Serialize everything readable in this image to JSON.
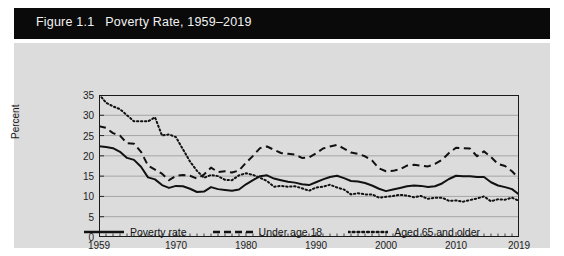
{
  "figure": {
    "title": "Figure 1.1   Poverty Rate, 1959–2019",
    "title_band_color": "#0a0a0a",
    "title_text_color": "#f2f2f2",
    "panel_color": "#dcdcdc"
  },
  "axes": {
    "ylabel": "Percent",
    "yticks": [
      "0",
      "5",
      "10",
      "15",
      "20",
      "25",
      "30",
      "35"
    ],
    "xticks": [
      "1959",
      "1970",
      "1980",
      "1990",
      "2000",
      "2010",
      "2019"
    ]
  },
  "legend": {
    "items": [
      {
        "label": "Poverty rate",
        "style": "solid",
        "color": "#111111"
      },
      {
        "label": "Under age 18",
        "style": "dashed",
        "color": "#111111"
      },
      {
        "label": "Aged 65 and older",
        "style": "dotted",
        "color": "#111111"
      }
    ]
  },
  "chart_data": {
    "type": "line",
    "title": "Figure 1.1   Poverty Rate, 1959–2019",
    "xlabel": "",
    "ylabel": "Percent",
    "xlim": [
      1959,
      2019
    ],
    "ylim": [
      0,
      35
    ],
    "ytick_step": 5,
    "grid": "horizontal",
    "legend_position": "bottom-center",
    "x": [
      1959,
      1960,
      1961,
      1962,
      1963,
      1964,
      1965,
      1966,
      1967,
      1968,
      1969,
      1970,
      1971,
      1972,
      1973,
      1974,
      1975,
      1976,
      1977,
      1978,
      1979,
      1980,
      1981,
      1982,
      1983,
      1984,
      1985,
      1986,
      1987,
      1988,
      1989,
      1990,
      1991,
      1992,
      1993,
      1994,
      1995,
      1996,
      1997,
      1998,
      1999,
      2000,
      2001,
      2002,
      2003,
      2004,
      2005,
      2006,
      2007,
      2008,
      2009,
      2010,
      2011,
      2012,
      2013,
      2014,
      2015,
      2016,
      2017,
      2018,
      2019
    ],
    "series": [
      {
        "name": "Poverty rate",
        "style": "solid",
        "values": [
          22.4,
          22.2,
          21.9,
          21.0,
          19.5,
          19.0,
          17.3,
          14.7,
          14.2,
          12.8,
          12.1,
          12.6,
          12.5,
          11.9,
          11.1,
          11.2,
          12.3,
          11.8,
          11.6,
          11.4,
          11.7,
          13.0,
          14.0,
          15.0,
          15.2,
          14.4,
          14.0,
          13.6,
          13.4,
          13.0,
          12.8,
          13.5,
          14.2,
          14.8,
          15.1,
          14.5,
          13.8,
          13.7,
          13.3,
          12.7,
          11.9,
          11.3,
          11.7,
          12.1,
          12.5,
          12.7,
          12.6,
          12.3,
          12.5,
          13.2,
          14.3,
          15.1,
          15.0,
          15.0,
          14.8,
          14.8,
          13.5,
          12.7,
          12.3,
          11.8,
          10.5
        ]
      },
      {
        "name": "Under age 18",
        "style": "dashed",
        "values": [
          27.3,
          26.9,
          25.6,
          25.0,
          23.1,
          23.0,
          21.0,
          17.6,
          16.6,
          15.6,
          14.0,
          15.1,
          15.3,
          15.1,
          14.4,
          15.4,
          17.1,
          16.0,
          16.2,
          15.9,
          16.4,
          18.3,
          20.0,
          21.9,
          22.3,
          21.5,
          20.7,
          20.5,
          20.3,
          19.5,
          19.6,
          20.6,
          21.8,
          22.3,
          22.7,
          21.8,
          20.8,
          20.5,
          19.9,
          18.9,
          16.9,
          16.2,
          16.3,
          16.7,
          17.6,
          17.8,
          17.6,
          17.4,
          18.0,
          19.0,
          20.7,
          22.0,
          21.9,
          21.8,
          19.9,
          21.1,
          19.7,
          18.0,
          17.5,
          16.2,
          14.4
        ]
      },
      {
        "name": "Aged 65 and older",
        "style": "dotted",
        "values": [
          35.2,
          33.1,
          32.2,
          31.5,
          30.0,
          28.5,
          28.5,
          28.5,
          29.5,
          25.0,
          25.3,
          24.6,
          21.6,
          18.6,
          16.3,
          14.6,
          15.3,
          15.0,
          14.1,
          14.0,
          15.2,
          15.7,
          15.3,
          14.6,
          13.8,
          12.4,
          12.6,
          12.4,
          12.5,
          12.0,
          11.4,
          12.2,
          12.4,
          12.9,
          12.2,
          11.7,
          10.5,
          10.8,
          10.5,
          10.5,
          9.7,
          9.9,
          10.1,
          10.4,
          10.2,
          9.8,
          10.1,
          9.4,
          9.7,
          9.7,
          8.9,
          9.0,
          8.7,
          9.1,
          9.5,
          10.0,
          8.8,
          9.3,
          9.2,
          9.7,
          8.9
        ]
      }
    ]
  }
}
